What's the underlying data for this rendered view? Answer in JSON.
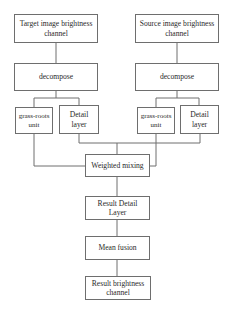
{
  "diagram": {
    "nodes": {
      "target": "Target image brightness channel",
      "source": "Source image brightness channel",
      "decompose_left": "decompose",
      "decompose_right": "decompose",
      "base_left": "grass-roots unit",
      "detail_left": "Detail layer",
      "base_right": "grass-roots unit",
      "detail_right": "Detail layer",
      "weighted": "Weighted mixing",
      "result_detail": "Result Detail Layer",
      "mean_fusion": "Mean fusion",
      "result_brightness": "Result brightness channel"
    },
    "edges": [
      [
        "target",
        "decompose_left"
      ],
      [
        "source",
        "decompose_right"
      ],
      [
        "decompose_left",
        "base_left"
      ],
      [
        "decompose_left",
        "detail_left"
      ],
      [
        "decompose_right",
        "base_right"
      ],
      [
        "decompose_right",
        "detail_right"
      ],
      [
        "base_left",
        "weighted"
      ],
      [
        "detail_left",
        "weighted"
      ],
      [
        "base_right",
        "weighted"
      ],
      [
        "detail_right",
        "weighted"
      ],
      [
        "weighted",
        "result_detail"
      ],
      [
        "result_detail",
        "mean_fusion"
      ],
      [
        "mean_fusion",
        "result_brightness"
      ]
    ],
    "colors": {
      "stroke": "#6e6e6e",
      "text": "#2a2a2a",
      "background": "#ffffff"
    }
  }
}
